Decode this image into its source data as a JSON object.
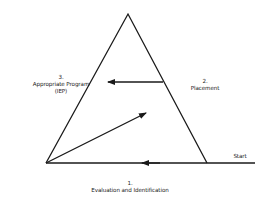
{
  "diagram": {
    "type": "process-triangle",
    "nodes": [
      {
        "id": "1",
        "number": "1.",
        "label": "Evaluation and Identification",
        "position": "bottom"
      },
      {
        "id": "2",
        "number": "2.",
        "label": "Placement",
        "position": "right"
      },
      {
        "id": "3",
        "number": "3.",
        "label": "Appropriate Program",
        "sublabel": "(IEP)",
        "position": "left"
      }
    ],
    "start_label": "Start",
    "edges": [
      {
        "from": "start",
        "to": "1",
        "description": "arrow along base, right to left"
      },
      {
        "from": "1",
        "to": "2",
        "description": "diagonal arrow from bottom-left corner up-right"
      },
      {
        "from": "2",
        "to": "3",
        "description": "horizontal arrow from right edge pointing left"
      }
    ],
    "colors": {
      "line": "#1a1a1a",
      "background": "#ffffff"
    }
  }
}
